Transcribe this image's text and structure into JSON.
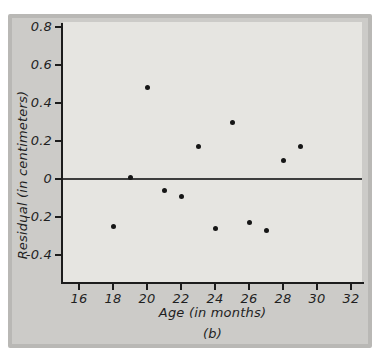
{
  "figure": {
    "caption": "(b)"
  },
  "chart_data": {
    "type": "scatter",
    "title": "",
    "xlabel": "Age (in months)",
    "ylabel": "Residual (in centimeters)",
    "xlim": [
      15,
      33
    ],
    "ylim": [
      -0.55,
      0.83
    ],
    "x_ticks": [
      "16",
      "18",
      "20",
      "22",
      "24",
      "26",
      "28",
      "30",
      "32"
    ],
    "y_ticks": [
      {
        "value": 0.8,
        "label": "0.8"
      },
      {
        "value": 0.6,
        "label": "0.6"
      },
      {
        "value": 0.4,
        "label": "0.4"
      },
      {
        "value": 0.2,
        "label": "0.2"
      },
      {
        "value": 0,
        "label": "0"
      },
      {
        "value": -0.2,
        "label": "-0.2"
      },
      {
        "value": -0.4,
        "label": "-0.4"
      }
    ],
    "zero_reference_line": true,
    "legend": null,
    "grid": false,
    "points": [
      {
        "age": 18,
        "residual": -0.25
      },
      {
        "age": 19,
        "residual": 0.01
      },
      {
        "age": 20,
        "residual": 0.48
      },
      {
        "age": 21,
        "residual": -0.06
      },
      {
        "age": 22,
        "residual": -0.09
      },
      {
        "age": 23,
        "residual": 0.17
      },
      {
        "age": 24,
        "residual": -0.26
      },
      {
        "age": 25,
        "residual": 0.3
      },
      {
        "age": 26,
        "residual": -0.23
      },
      {
        "age": 27,
        "residual": -0.27
      },
      {
        "age": 28,
        "residual": 0.1
      },
      {
        "age": 29,
        "residual": 0.17
      }
    ],
    "colors": {
      "page_bg": "#ffffff",
      "panel_bg": "#cccbc8",
      "panel_border": "#b9b8b5",
      "plot_bg": "#e6e5e1",
      "axis": "#1c1c1c",
      "zero_line": "#3d3d3d",
      "dot": "#161616",
      "text": "#1f1f1f"
    }
  }
}
